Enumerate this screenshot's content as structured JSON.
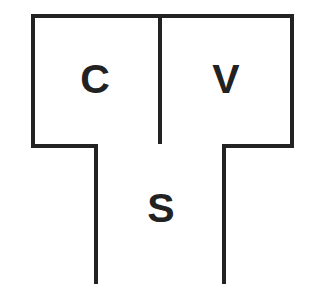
{
  "diagram": {
    "boxes": [
      {
        "id": "c",
        "label": "C"
      },
      {
        "id": "v",
        "label": "V"
      },
      {
        "id": "s",
        "label": "S"
      }
    ],
    "colors": {
      "stroke": "#222222",
      "fill": "#ffffff",
      "text": "#222222"
    }
  }
}
